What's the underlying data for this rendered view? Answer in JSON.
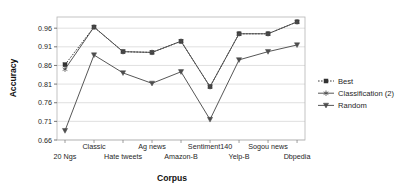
{
  "chart_data": {
    "type": "line",
    "title": "",
    "xlabel": "Corpus",
    "ylabel": "Accuracy",
    "categories": [
      "20 Ngs",
      "Classic",
      "Hate tweets",
      "Ag news",
      "Amazon-B",
      "Sentiment140",
      "Yelp-B",
      "Sogou news",
      "Dbpedia"
    ],
    "ylim": [
      0.66,
      0.99
    ],
    "yticks": [
      0.66,
      0.71,
      0.76,
      0.81,
      0.86,
      0.91,
      0.96
    ],
    "ytick_labels": [
      "0.66",
      "0.71",
      "0.76",
      "0.81",
      "0.86",
      "0.91",
      "0.96"
    ],
    "grid": "horizontal",
    "legend_position": "right",
    "series": [
      {
        "name": "Best",
        "marker": "square",
        "linestyle": "dotted",
        "color": "#333333",
        "values": [
          0.862,
          0.963,
          0.897,
          0.895,
          0.925,
          0.803,
          0.945,
          0.945,
          0.977
        ]
      },
      {
        "name": "Classification (2)",
        "marker": "star",
        "linestyle": "solid",
        "color": "#4d4d4d",
        "values": [
          0.85,
          0.963,
          0.897,
          0.895,
          0.925,
          0.803,
          0.945,
          0.945,
          0.977
        ]
      },
      {
        "name": "Random",
        "marker": "triangle-down",
        "linestyle": "solid",
        "color": "#4d4d4d",
        "values": [
          0.685,
          0.888,
          0.84,
          0.812,
          0.843,
          0.715,
          0.875,
          0.897,
          0.915
        ]
      }
    ]
  },
  "axes": {
    "ylabel": "Accuracy",
    "xlabel": "Corpus"
  },
  "legend": {
    "items": [
      {
        "label": "Best"
      },
      {
        "label": "Classification (2)"
      },
      {
        "label": "Random"
      }
    ]
  }
}
